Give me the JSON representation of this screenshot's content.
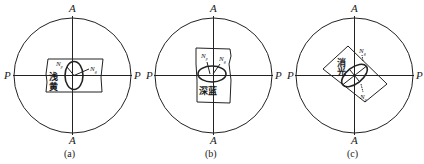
{
  "panels": [
    {
      "caption": "(a)",
      "axis_top": "A",
      "axis_bottom": "A",
      "axis_left": "P",
      "axis_right": "P",
      "n_label_1": "N",
      "n_sub_1": "p",
      "n_label_2": "N",
      "n_sub_2": "g",
      "color_text_1": "浅",
      "color_text_2": "黄"
    },
    {
      "caption": "(b)",
      "axis_top": "A",
      "axis_bottom": "A",
      "axis_left": "P",
      "axis_right": "P",
      "n_label_1": "N",
      "n_sub_1": "p",
      "n_label_2": "N",
      "n_sub_2": "g",
      "color_text": "深蓝"
    },
    {
      "caption": "(c)",
      "axis_top": "A",
      "axis_bottom": "A",
      "axis_left": "P",
      "axis_right": "P",
      "n_label_1": "N",
      "n_sub_1": "g",
      "n_label_2": "N",
      "n_sub_2": "p",
      "color_text_1": "消",
      "color_text_2": "光"
    }
  ]
}
